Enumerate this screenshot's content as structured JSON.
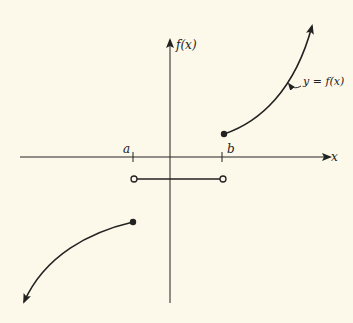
{
  "diagram": {
    "type": "piecewise-function-graph",
    "axes": {
      "x_label": "x",
      "y_label": "f(x)"
    },
    "ticks": [
      {
        "label": "a"
      },
      {
        "label": "b"
      }
    ],
    "curve_label": "y = f(x)",
    "pieces": [
      {
        "domain": "x ≤ a",
        "shape": "increasing concave curve",
        "endpoint": "closed at a",
        "extends": "down-left arrow"
      },
      {
        "domain": "a < x < b",
        "shape": "horizontal segment below x-axis",
        "endpoints": "open at a and b"
      },
      {
        "domain": "x ≥ b",
        "shape": "increasing convex curve",
        "endpoint": "closed at b",
        "extends": "up-right arrow"
      }
    ],
    "colors": {
      "background": "#fcf8ea",
      "ink": "#222222"
    }
  }
}
